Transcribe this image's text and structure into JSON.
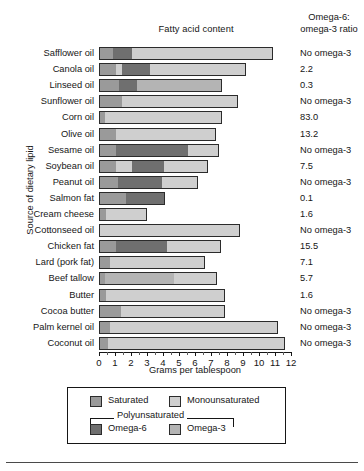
{
  "chart_data": {
    "type": "bar",
    "orientation": "horizontal",
    "stacked": true,
    "title": "Fatty acid content",
    "xlabel": "Grams per tablespoon",
    "ylabel": "Source of dietary lipid",
    "xlim": [
      0,
      12
    ],
    "xticks": [
      0,
      1,
      2,
      3,
      4,
      5,
      6,
      7,
      8,
      9,
      10,
      11,
      12
    ],
    "xtick_labels": [
      "0",
      "1",
      "2",
      "3",
      "4",
      "5",
      "6",
      "7",
      "8",
      "9",
      "10",
      "11",
      "12"
    ],
    "minor_ticks": true,
    "grid": false,
    "legend_position": "below-axis",
    "series": [
      {
        "name": "Saturated",
        "key": "sat",
        "color": "#9a9a9a"
      },
      {
        "name": "Monounsaturated",
        "key": "mono",
        "color": "#cfcfcf"
      },
      {
        "name": "Omega-6",
        "key": "o6",
        "color": "#6f6f6f",
        "group": "Polyunsaturated"
      },
      {
        "name": "Omega-3",
        "key": "o3",
        "color": "#b4b4b4",
        "group": "Polyunsaturated"
      }
    ],
    "categories": [
      "Safflower oil",
      "Canola oil",
      "Linseed oil",
      "Sunflower oil",
      "Corn oil",
      "Olive oil",
      "Sesame oil",
      "Soybean oil",
      "Peanut oil",
      "Salmon fat",
      "Cream cheese",
      "Cottonseed oil",
      "Chicken fat",
      "Lard (pork fat)",
      "Beef tallow",
      "Butter",
      "Cocoa butter",
      "Palm kernel oil",
      "Coconut oil"
    ],
    "rows": [
      {
        "category": "Safflower oil",
        "sat": 0.8,
        "mono": 0.0,
        "o6": 1.2,
        "o3": 0.0,
        "mono_tail": 8.9,
        "ratio": "No omega-3"
      },
      {
        "category": "Canola oil",
        "sat": 1.0,
        "mono": 0.4,
        "o6": 1.7,
        "o3": 0.0,
        "mono_tail": 6.1,
        "ratio": "2.2"
      },
      {
        "category": "Linseed oil",
        "sat": 1.2,
        "mono": 0.0,
        "o6": 1.1,
        "o3": 5.4,
        "mono_tail": 0.0,
        "ratio": "0.3"
      },
      {
        "category": "Sunflower oil",
        "sat": 1.4,
        "mono": 0.7,
        "o6": 0.0,
        "o3": 0.0,
        "mono_tail": 6.6,
        "ratio": "No omega-3"
      },
      {
        "category": "Corn oil",
        "sat": 0.3,
        "mono": 1.5,
        "o6": 0.0,
        "o3": 0.0,
        "mono_tail": 5.9,
        "ratio": "83.0"
      },
      {
        "category": "Olive oil",
        "sat": 1.0,
        "mono": 1.0,
        "o6": 0.0,
        "o3": 0.0,
        "mono_tail": 5.3,
        "ratio": "13.2"
      },
      {
        "category": "Sesame oil",
        "sat": 1.0,
        "mono": 0.0,
        "o6": 4.5,
        "o3": 0.0,
        "mono_tail": 2.0,
        "ratio": "No omega-3"
      },
      {
        "category": "Soybean oil",
        "sat": 1.0,
        "mono": 1.0,
        "o6": 2.0,
        "o3": 0.0,
        "mono_tail": 2.8,
        "ratio": "7.5"
      },
      {
        "category": "Peanut oil",
        "sat": 1.1,
        "mono": 0.0,
        "o6": 2.8,
        "o3": 0.0,
        "mono_tail": 2.3,
        "ratio": "No omega-3"
      },
      {
        "category": "Salmon fat",
        "sat": 1.6,
        "mono": 0.0,
        "o6": 2.5,
        "o3": 0.0,
        "mono_tail": 0.0,
        "ratio": "0.1"
      },
      {
        "category": "Cream cheese",
        "sat": 0.4,
        "mono": 1.7,
        "o6": 0.0,
        "o3": 0.0,
        "mono_tail": 0.9,
        "ratio": "1.6"
      },
      {
        "category": "Cottonseed oil",
        "sat": 0.0,
        "mono": 4.6,
        "o6": 0.0,
        "o3": 0.0,
        "mono_tail": 4.2,
        "ratio": "No omega-3"
      },
      {
        "category": "Chicken fat",
        "sat": 1.0,
        "mono": 0.0,
        "o6": 3.2,
        "o3": 0.0,
        "mono_tail": 3.4,
        "ratio": "15.5"
      },
      {
        "category": "Lard (pork fat)",
        "sat": 0.6,
        "mono": 2.0,
        "o6": 0.0,
        "o3": 0.0,
        "mono_tail": 4.0,
        "ratio": "7.1"
      },
      {
        "category": "Beef tallow",
        "sat": 0.3,
        "mono": 0.0,
        "o6": 0.0,
        "o3": 4.3,
        "mono_tail": 2.8,
        "ratio": "5.7"
      },
      {
        "category": "Butter",
        "sat": 0.4,
        "mono": 4.3,
        "o6": 0.0,
        "o3": 0.0,
        "mono_tail": 3.2,
        "ratio": "1.6"
      },
      {
        "category": "Cocoa butter",
        "sat": 1.3,
        "mono": 0.0,
        "o6": 0.0,
        "o3": 0.0,
        "mono_tail": 6.6,
        "ratio": "No omega-3"
      },
      {
        "category": "Palm kernel oil",
        "sat": 0.6,
        "mono": 1.2,
        "o6": 0.0,
        "o3": 0.0,
        "mono_tail": 9.4,
        "ratio": "No omega-3"
      },
      {
        "category": "Coconut oil",
        "sat": 0.5,
        "mono": 0.7,
        "o6": 0.0,
        "o3": 0.0,
        "mono_tail": 10.4,
        "ratio": "No omega-3"
      }
    ]
  },
  "headers": {
    "chart_title": "Fatty acid content",
    "ratio_line1": "Omega-6:",
    "ratio_line2": "omega-3 ratio",
    "y_axis_title": "Source of dietary lipid",
    "x_axis_title": "Grams per tablespoon"
  },
  "legend": {
    "saturated": "Saturated",
    "monounsaturated": "Monounsaturated",
    "polyunsaturated": "Polyunsaturated",
    "omega6": "Omega-6",
    "omega3": "Omega-3"
  },
  "colors": {
    "saturated": "#9a9a9a",
    "monounsaturated": "#cfcfcf",
    "omega6": "#6f6f6f",
    "omega3": "#b4b4b4",
    "text": "#161616",
    "background": "#ffffff"
  }
}
